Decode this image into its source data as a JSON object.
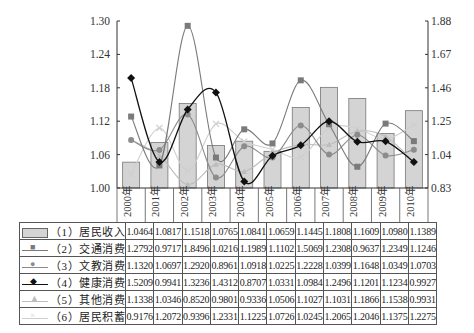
{
  "chart_data": {
    "type": "bar",
    "title": "",
    "xlabel": "",
    "categories": [
      "2000年",
      "2001年",
      "2002年",
      "2003年",
      "2004年",
      "2005年",
      "2006年",
      "2007年",
      "2008年",
      "2009年",
      "2010年"
    ],
    "left_axis": {
      "ylim": [
        1.0,
        1.3
      ],
      "ticks": [
        "1.00",
        "1.06",
        "1.12",
        "1.18",
        "1.24",
        "1.30"
      ]
    },
    "right_axis": {
      "ylim": [
        0.83,
        1.88
      ],
      "ticks": [
        "0.83",
        "1.04",
        "1.25",
        "1.46",
        "1.67",
        "1.88"
      ]
    },
    "grid": false,
    "legend_position": "table-left",
    "series": [
      {
        "name": "（1）居民收入",
        "type": "bar",
        "axis": "left",
        "color": "#d4d4d4",
        "values": [
          1.0464,
          1.0817,
          1.1518,
          1.0765,
          1.0841,
          1.0659,
          1.1445,
          1.1808,
          1.1609,
          1.098,
          1.1389
        ]
      },
      {
        "name": "（2）交通消费",
        "type": "line",
        "axis": "right",
        "marker": "square",
        "color": "#7a7a7a",
        "values": [
          1.2792,
          0.9717,
          1.8496,
          1.0216,
          1.1989,
          1.1102,
          1.5069,
          1.2308,
          0.9637,
          1.2349,
          1.1246
        ]
      },
      {
        "name": "（3）文教消费",
        "type": "line",
        "axis": "right",
        "marker": "circle",
        "color": "#8c8c8c",
        "values": [
          1.132,
          1.0697,
          1.292,
          0.8961,
          1.0918,
          1.0225,
          1.2228,
          1.0399,
          1.1648,
          1.0349,
          1.0703
        ]
      },
      {
        "name": "（4）健康消费",
        "type": "line",
        "axis": "right",
        "marker": "diamond",
        "color": "#111111",
        "values": [
          1.5209,
          0.9941,
          1.3236,
          1.4312,
          0.8707,
          1.0331,
          1.0984,
          1.2496,
          1.1201,
          1.1234,
          0.9927
        ]
      },
      {
        "name": "（5）其他消费",
        "type": "line",
        "axis": "right",
        "marker": "triangle",
        "color": "#bdbdbd",
        "values": [
          1.1338,
          1.0346,
          0.852,
          0.9801,
          0.9336,
          1.0506,
          1.1027,
          1.1031,
          1.1866,
          1.1538,
          0.9931
        ]
      },
      {
        "name": "（6）居民积蓄",
        "type": "line",
        "axis": "right",
        "marker": "cross",
        "color": "#cfcfcf",
        "values": [
          0.9176,
          1.2072,
          0.9396,
          1.2331,
          1.1225,
          1.0726,
          1.0245,
          1.2065,
          1.2046,
          1.1375,
          1.2275
        ]
      }
    ]
  }
}
